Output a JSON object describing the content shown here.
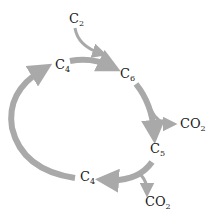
{
  "diagram": {
    "type": "metabolic-cycle",
    "arrow_color": "#a9a9a9",
    "nodes": [
      {
        "id": "c2",
        "base": "C",
        "sub": "2"
      },
      {
        "id": "c4_top",
        "base": "C",
        "sub": "4"
      },
      {
        "id": "c6",
        "base": "C",
        "sub": "6"
      },
      {
        "id": "co2_right",
        "base": "CO",
        "sub": "2"
      },
      {
        "id": "c5",
        "base": "C",
        "sub": "5"
      },
      {
        "id": "c4_bottom",
        "base": "C",
        "sub": "4"
      },
      {
        "id": "co2_bottom",
        "base": "CO",
        "sub": "2"
      }
    ],
    "edges": [
      {
        "from": "c2",
        "to": "c6"
      },
      {
        "from": "c4_top",
        "to": "c6"
      },
      {
        "from": "c6",
        "to": "c5"
      },
      {
        "from": "c6",
        "to": "co2_right"
      },
      {
        "from": "c5",
        "to": "c4_bottom"
      },
      {
        "from": "c5",
        "to": "co2_bottom"
      },
      {
        "from": "c4_bottom",
        "to": "c4_top"
      }
    ]
  }
}
